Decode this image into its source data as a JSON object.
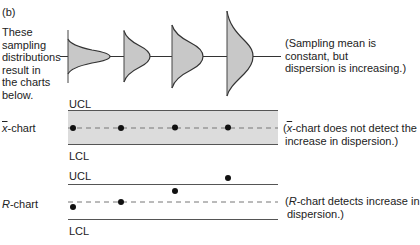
{
  "figure": {
    "panel_label": "(b)",
    "intro_lines": [
      "These",
      "sampling",
      "distributions",
      "result in",
      "the charts",
      "below."
    ],
    "distribution_note_lines": [
      "(Sampling mean is",
      "constant, but",
      "dispersion is increasing.)"
    ],
    "xbar_chart": {
      "name_symbol": "x",
      "name_suffix": "-chart",
      "ucl_label": "UCL",
      "lcl_label": "LCL",
      "note_prefix": "(",
      "note_symbol": "x",
      "note_line1_rest": "-chart does not detect the",
      "note_line2": "increase in dispersion.)",
      "band_color": "#dcdcdc"
    },
    "r_chart": {
      "name_symbol": "R",
      "name_suffix": "-chart",
      "ucl_label": "UCL",
      "lcl_label": "LCL",
      "note_prefix": "(",
      "note_symbol": "R",
      "note_line1_rest": "-chart detects increase in",
      "note_line2": "dispersion.)"
    },
    "colors": {
      "curve_fill": "#c8c8c8",
      "line": "#333333",
      "dashed": "#777777",
      "dot": "#111111"
    }
  }
}
